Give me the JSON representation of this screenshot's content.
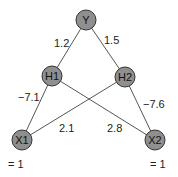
{
  "nodes": {
    "Y": {
      "label": "Y"
    },
    "H1": {
      "label": "H1"
    },
    "H2": {
      "label": "H2"
    },
    "X1": {
      "label": "X1"
    },
    "X2": {
      "label": "X2"
    }
  },
  "edges": {
    "Y_H1": {
      "weight": "1.2"
    },
    "Y_H2": {
      "weight": "1.5"
    },
    "H1_X1": {
      "weight": "−7.1"
    },
    "H2_X2": {
      "weight": "−7.6"
    },
    "H2_X1": {
      "weight": "2.1"
    },
    "H1_X2": {
      "weight": "2.8"
    }
  },
  "inputs": {
    "X1_value": "= 1",
    "X2_value": "= 1"
  },
  "colors": {
    "node_fill": "#8f8f8f",
    "node_stroke": "#333333",
    "edge": "#555555"
  }
}
